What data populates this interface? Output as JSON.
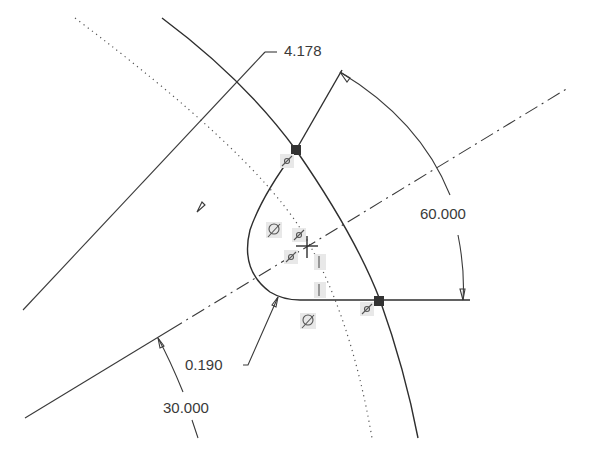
{
  "view": {
    "title": "Sketch with dimensions and constraints",
    "background": "#ffffff",
    "line_color": "#2e2e2e",
    "point_color": "#333333"
  },
  "dimensions": [
    {
      "id": "radius-outer",
      "value": "4.178",
      "type": "radius"
    },
    {
      "id": "angle-60",
      "value": "60.000",
      "type": "angle"
    },
    {
      "id": "fillet-radius",
      "value": "0.190",
      "type": "radius"
    },
    {
      "id": "angle-30",
      "value": "30.000",
      "type": "angle"
    }
  ],
  "constraints": [
    {
      "id": "coincident-top",
      "symbol": "coincident-icon"
    },
    {
      "id": "tangent-left",
      "symbol": "tangent-icon"
    },
    {
      "id": "coincident-center-1",
      "symbol": "coincident-icon"
    },
    {
      "id": "coincident-center-2",
      "symbol": "coincident-icon"
    },
    {
      "id": "vertical-1",
      "symbol": "vertical-icon"
    },
    {
      "id": "vertical-2",
      "symbol": "vertical-icon"
    },
    {
      "id": "tangent-bottom",
      "symbol": "tangent-icon"
    },
    {
      "id": "coincident-right",
      "symbol": "coincident-icon"
    }
  ],
  "points": [
    {
      "id": "intersection-top",
      "x": 296,
      "y": 150
    },
    {
      "id": "intersection-right",
      "x": 379,
      "y": 301
    },
    {
      "id": "sketch-origin",
      "x": 307,
      "y": 246
    }
  ]
}
